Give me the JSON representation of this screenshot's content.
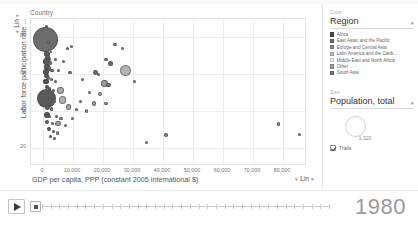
{
  "chart_data": {
    "type": "scatter",
    "title": "",
    "xlabel": "GDP per capita, PPP (constant 2005 international $)",
    "ylabel": "Labor force participation rate ...",
    "xlim": [
      -4000,
      88000
    ],
    "ylim": [
      10,
      90
    ],
    "xticks": [
      "0",
      "10,000",
      "20,000",
      "30,000",
      "40,000",
      "50,000",
      "60,000",
      "70,000",
      "80,000"
    ],
    "xtick_values": [
      0,
      10000,
      20000,
      30000,
      40000,
      50000,
      60000,
      70000,
      80000
    ],
    "yticks": [
      "80",
      "60",
      "40",
      "20"
    ],
    "ytick_values": [
      80,
      60,
      40,
      20
    ],
    "grid": true,
    "legend_position": "right",
    "size_encoding": "Population, total",
    "color_encoding": "Region",
    "series_label": "Country",
    "year": "1980",
    "points": [
      {
        "x": 1200,
        "y": 86,
        "r": 1.6,
        "c": "#6f6f6f"
      },
      {
        "x": 1500,
        "y": 83,
        "r": 1.4,
        "c": "#5f5f5f"
      },
      {
        "x": 900,
        "y": 79,
        "r": 12.5,
        "c": "#6d6d6d"
      },
      {
        "x": 1700,
        "y": 77,
        "r": 1.6,
        "c": "#777"
      },
      {
        "x": 9500,
        "y": 75,
        "r": 1.8,
        "c": "#8a8a8a"
      },
      {
        "x": 8200,
        "y": 74,
        "r": 1.5,
        "c": "#7d7d7d"
      },
      {
        "x": 24000,
        "y": 76,
        "r": 1.6,
        "c": "#888"
      },
      {
        "x": 26500,
        "y": 74,
        "r": 1.5,
        "c": "#8c8c8c"
      },
      {
        "x": 2600,
        "y": 72,
        "r": 1.3,
        "c": "#6a6a6a"
      },
      {
        "x": 1300,
        "y": 71,
        "r": 3.2,
        "c": "#5c5c5c"
      },
      {
        "x": 1600,
        "y": 69,
        "r": 2.6,
        "c": "#636363"
      },
      {
        "x": 2000,
        "y": 68,
        "r": 2.0,
        "c": "#6b6b6b"
      },
      {
        "x": 1100,
        "y": 67,
        "r": 3.6,
        "c": "#585858"
      },
      {
        "x": 2400,
        "y": 66,
        "r": 1.8,
        "c": "#707070"
      },
      {
        "x": 4300,
        "y": 68,
        "r": 1.5,
        "c": "#7a7a7a"
      },
      {
        "x": 6800,
        "y": 67,
        "r": 1.5,
        "c": "#808080"
      },
      {
        "x": 21000,
        "y": 68,
        "r": 1.8,
        "c": "#7f7f7f"
      },
      {
        "x": 22500,
        "y": 66,
        "r": 2.6,
        "c": "#6e6e6e"
      },
      {
        "x": 1400,
        "y": 64,
        "r": 2.8,
        "c": "#5a5a5a"
      },
      {
        "x": 1900,
        "y": 63,
        "r": 2.2,
        "c": "#666"
      },
      {
        "x": 3000,
        "y": 62,
        "r": 1.7,
        "c": "#6f6f6f"
      },
      {
        "x": 900,
        "y": 61,
        "r": 3.0,
        "c": "#545454"
      },
      {
        "x": 5200,
        "y": 62,
        "r": 1.5,
        "c": "#787878"
      },
      {
        "x": 9000,
        "y": 61,
        "r": 1.6,
        "c": "#828282"
      },
      {
        "x": 27500,
        "y": 62,
        "r": 5.6,
        "c": "#b4b4b4"
      },
      {
        "x": 17500,
        "y": 61,
        "r": 2.4,
        "c": "#6c6c6c"
      },
      {
        "x": 18500,
        "y": 60,
        "r": 1.6,
        "c": "#8e8e8e"
      },
      {
        "x": 1200,
        "y": 59,
        "r": 2.4,
        "c": "#5e5e5e"
      },
      {
        "x": 1800,
        "y": 58,
        "r": 2.0,
        "c": "#6a6a6a"
      },
      {
        "x": 2700,
        "y": 57,
        "r": 1.6,
        "c": "#747474"
      },
      {
        "x": 1000,
        "y": 56,
        "r": 2.6,
        "c": "#505050"
      },
      {
        "x": 4000,
        "y": 56,
        "r": 1.5,
        "c": "#7c7c7c"
      },
      {
        "x": 13000,
        "y": 57,
        "r": 1.5,
        "c": "#868686"
      },
      {
        "x": 20500,
        "y": 55,
        "r": 3.2,
        "c": "#9c9c9c"
      },
      {
        "x": 21800,
        "y": 54,
        "r": 2.2,
        "c": "#777"
      },
      {
        "x": 30500,
        "y": 56,
        "r": 1.5,
        "c": "#8a8a8a"
      },
      {
        "x": 1300,
        "y": 53,
        "r": 2.2,
        "c": "#5b5b5b"
      },
      {
        "x": 2200,
        "y": 52,
        "r": 1.8,
        "c": "#686868"
      },
      {
        "x": 3500,
        "y": 51,
        "r": 1.5,
        "c": "#757575"
      },
      {
        "x": 900,
        "y": 50,
        "r": 2.8,
        "c": "#4e4e4e"
      },
      {
        "x": 5800,
        "y": 51,
        "r": 3.4,
        "c": "#aeaeae"
      },
      {
        "x": 15500,
        "y": 50,
        "r": 1.6,
        "c": "#8b8b8b"
      },
      {
        "x": 19000,
        "y": 49,
        "r": 2.0,
        "c": "#9a9a9a"
      },
      {
        "x": 1100,
        "y": 47,
        "r": 9.5,
        "c": "#5a5a5a"
      },
      {
        "x": 2500,
        "y": 46,
        "r": 1.7,
        "c": "#6e6e6e"
      },
      {
        "x": 3800,
        "y": 45,
        "r": 1.5,
        "c": "#7b7b7b"
      },
      {
        "x": 6500,
        "y": 46,
        "r": 3.8,
        "c": "#b0b0b0"
      },
      {
        "x": 12500,
        "y": 45,
        "r": 1.5,
        "c": "#898989"
      },
      {
        "x": 17000,
        "y": 44,
        "r": 2.2,
        "c": "#9e9e9e"
      },
      {
        "x": 21000,
        "y": 44,
        "r": 1.8,
        "c": "#8f8f8f"
      },
      {
        "x": 1600,
        "y": 42,
        "r": 2.4,
        "c": "#5d5d5d"
      },
      {
        "x": 2900,
        "y": 41,
        "r": 1.6,
        "c": "#6d6d6d"
      },
      {
        "x": 8500,
        "y": 42,
        "r": 2.8,
        "c": "#a6a6a6"
      },
      {
        "x": 11000,
        "y": 41,
        "r": 1.5,
        "c": "#858585"
      },
      {
        "x": 14500,
        "y": 40,
        "r": 1.7,
        "c": "#949494"
      },
      {
        "x": 1200,
        "y": 38,
        "r": 3.0,
        "c": "#565656"
      },
      {
        "x": 2100,
        "y": 37,
        "r": 1.8,
        "c": "#696969"
      },
      {
        "x": 4500,
        "y": 37,
        "r": 1.5,
        "c": "#7e7e7e"
      },
      {
        "x": 6000,
        "y": 36,
        "r": 1.6,
        "c": "#8d8d8d"
      },
      {
        "x": 9800,
        "y": 36,
        "r": 1.5,
        "c": "#8a8a8a"
      },
      {
        "x": 1400,
        "y": 34,
        "r": 2.2,
        "c": "#5f5f5f"
      },
      {
        "x": 3200,
        "y": 33,
        "r": 1.6,
        "c": "#717171"
      },
      {
        "x": 5000,
        "y": 33,
        "r": 2.6,
        "c": "#a2a2a2"
      },
      {
        "x": 7500,
        "y": 32,
        "r": 1.5,
        "c": "#888"
      },
      {
        "x": 2000,
        "y": 30,
        "r": 2.0,
        "c": "#626262"
      },
      {
        "x": 3600,
        "y": 29,
        "r": 1.5,
        "c": "#767676"
      },
      {
        "x": 4800,
        "y": 28,
        "r": 1.6,
        "c": "#999"
      },
      {
        "x": 2400,
        "y": 26,
        "r": 1.7,
        "c": "#666"
      },
      {
        "x": 3900,
        "y": 25,
        "r": 1.5,
        "c": "#7a7a7a"
      },
      {
        "x": 34500,
        "y": 23,
        "r": 1.5,
        "c": "#909090"
      },
      {
        "x": 41000,
        "y": 27,
        "r": 1.8,
        "c": "#8b8b8b"
      },
      {
        "x": 78500,
        "y": 33,
        "r": 1.8,
        "c": "#878787"
      },
      {
        "x": 85500,
        "y": 27,
        "r": 1.6,
        "c": "#8e8e8e"
      }
    ]
  },
  "chart_panel": {
    "country_label": "Country",
    "y_axis_title": "Labor force participation rate ...",
    "y_scale_caret": "▾",
    "y_scale_label": "Lin",
    "y_scale_caret2": "▾",
    "x_axis_title": "GDP per capita, PPP (constant 2005 international $)",
    "x_scale_caret": "▾",
    "x_scale_label": "Lin",
    "x_scale_caret2": "▾"
  },
  "sidebar": {
    "color_group": {
      "caption": "Color",
      "selected": "Region",
      "caret": "▾",
      "items": [
        {
          "label": "Africa",
          "swatch": "#4a4a4a"
        },
        {
          "label": "East Asian and the Pacific",
          "swatch": "#6b6b6b"
        },
        {
          "label": "Europe and Central Asia",
          "swatch": "#8c8c8c"
        },
        {
          "label": "Latin America and the Carib...",
          "swatch": "#bdbdbd"
        },
        {
          "label": "Middle East and North Africa",
          "swatch": "#f0f0f0"
        },
        {
          "label": "Other",
          "swatch": "#9e9e9e"
        },
        {
          "label": "South Asia",
          "swatch": "#777777"
        }
      ]
    },
    "size_group": {
      "caption": "Size",
      "selected": "Population, total",
      "caret": "▾",
      "bubble_value": "1,320"
    },
    "trails": {
      "label": "Trails",
      "checked": true
    }
  },
  "bottom_bar": {
    "play_icon": "play-triangle",
    "year": "1980",
    "slider_position_percent": 0
  }
}
